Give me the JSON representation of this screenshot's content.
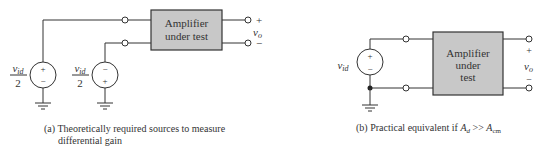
{
  "left": {
    "box_label_line1": "Amplifier",
    "box_label_line2": "under test",
    "source1": {
      "num": "v",
      "sub": "id",
      "den": "2",
      "top_sign": "+",
      "bottom_sign": "−"
    },
    "source2": {
      "num": "v",
      "sub": "id",
      "den": "2",
      "top_sign": "−",
      "bottom_sign": "+"
    },
    "out_plus": "+",
    "out_minus": "−",
    "out_v": "v",
    "out_sub": "o",
    "caption_line1": "(a) Theoretically required sources to measure",
    "caption_line2": "differential gain"
  },
  "right": {
    "box_label_line1": "Amplifier",
    "box_label_line2": "under",
    "box_label_line3": "test",
    "source": {
      "v": "v",
      "sub": "id",
      "top_sign": "+",
      "bottom_sign": "−"
    },
    "out_plus": "+",
    "out_minus": "−",
    "out_v": "v",
    "out_sub": "o",
    "caption_prefix": "(b) Practical equivalent if ",
    "caption_A": "A",
    "caption_Asub": "d",
    "caption_op": " >> ",
    "caption_B": "A",
    "caption_Bsub": "cm"
  },
  "colors": {
    "box_fill": "#c8c8c8",
    "line": "#333333"
  }
}
